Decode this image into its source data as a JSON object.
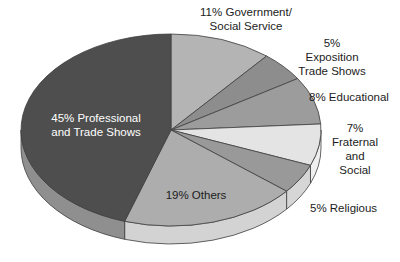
{
  "figure": {
    "background": "#ffffff"
  },
  "chart_data": {
    "type": "pie",
    "style": "3d-extruded",
    "unit": "%",
    "total": 100,
    "start_angle": "12-o-clock",
    "direction": "clockwise",
    "outline_color": "#3f3f3f",
    "layout": {
      "cx": 171,
      "cy": 130,
      "rx": 150,
      "ry": 96,
      "depth": 18
    },
    "slices": [
      {
        "label": "Government/Social Service",
        "value": 11,
        "pct_label": "11%",
        "callout_text": "11% Government/\nSocial Service",
        "color": "#b4b4b4",
        "side_color": "#d9d9d9",
        "callout": {
          "x": 246,
          "y": 19,
          "align": "center",
          "text_color": "#1c1c1c"
        }
      },
      {
        "label": "Exposition Trade Shows",
        "value": 5,
        "pct_label": "5%",
        "callout_text": "5% Exposition\nTrade Shows",
        "color": "#8d8d8d",
        "side_color": "#c9c9c9",
        "callout": {
          "x": 332,
          "y": 57,
          "align": "center",
          "text_color": "#1c1c1c"
        }
      },
      {
        "label": "Educational",
        "value": 8,
        "pct_label": "8%",
        "callout_text": "8% Educational",
        "color": "#9c9c9c",
        "side_color": "#cfcfcf",
        "callout": {
          "x": 309,
          "y": 97,
          "align": "left",
          "text_color": "#1c1c1c"
        }
      },
      {
        "label": "Fraternal and Social",
        "value": 7,
        "pct_label": "7%",
        "callout_text": "7% Fraternal\nand Social",
        "color": "#e4e4e4",
        "side_color": "#efefef",
        "callout": {
          "x": 355,
          "y": 149,
          "align": "center",
          "text_color": "#1c1c1c"
        }
      },
      {
        "label": "Religious",
        "value": 5,
        "pct_label": "5%",
        "callout_text": "5% Religious",
        "color": "#999999",
        "side_color": "#d6d6d6",
        "callout": {
          "x": 310,
          "y": 208,
          "align": "left",
          "text_color": "#1c1c1c"
        }
      },
      {
        "label": "Others",
        "value": 19,
        "pct_label": "19%",
        "callout_text": "19% Others",
        "color": "#adadad",
        "side_color": "#d3d3d3",
        "callout": {
          "x": 196,
          "y": 195,
          "align": "center",
          "text_color": "#1c1c1c"
        }
      },
      {
        "label": "Professional and Trade Shows",
        "value": 45,
        "pct_label": "45%",
        "callout_text": "45% Professional\nand Trade Shows",
        "color": "#4e4e4e",
        "side_color": "#8f8f8f",
        "callout": {
          "x": 96,
          "y": 125,
          "align": "center",
          "text_color": "#ffffff"
        }
      }
    ]
  }
}
